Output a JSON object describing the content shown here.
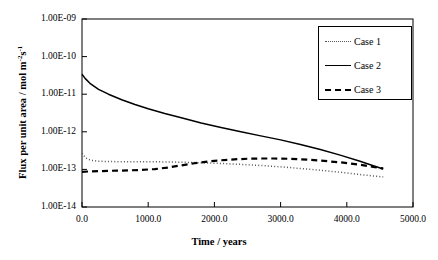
{
  "chart_data": {
    "type": "line",
    "title": "",
    "xlabel": "Time / years",
    "ylabel_html": "Flux  per unit area / mol m<sup>-2</sup>s<sup>-1</sup>",
    "ylabel_text": "Flux per unit area / mol m-2s-1",
    "xlim": [
      0,
      5000
    ],
    "ylim": [
      1e-14,
      1e-09
    ],
    "yscale": "log",
    "grid": false,
    "legend_position": "top-right",
    "xticks": [
      0,
      1000,
      2000,
      3000,
      4000,
      5000
    ],
    "xtick_labels": [
      "0.0",
      "1000.0",
      "2000.0",
      "3000.0",
      "4000.0",
      "5000.0"
    ],
    "yticks": [
      1e-09,
      1e-10,
      1e-11,
      1e-12,
      1e-13,
      1e-14
    ],
    "ytick_labels": [
      "1.00E-09",
      "1.00E-10",
      "1.00E-11",
      "1.00E-12",
      "1.00E-13",
      "1.00E-14"
    ],
    "series": [
      {
        "name": "Case 1",
        "style": "dotted",
        "color": "#555555",
        "x": [
          0,
          60,
          130,
          250,
          400,
          600,
          800,
          1000,
          1250,
          1500,
          1800,
          2100,
          2400,
          2700,
          3000,
          3300,
          3600,
          3900,
          4200,
          4400,
          4550
        ],
        "y": [
          2.7e-13,
          2e-13,
          1.75e-13,
          1.65e-13,
          1.62e-13,
          1.6e-13,
          1.6e-13,
          1.6e-13,
          1.58e-13,
          1.55e-13,
          1.5e-13,
          1.44e-13,
          1.36e-13,
          1.27e-13,
          1.17e-13,
          1.06e-13,
          9.5e-14,
          8.4e-14,
          7.3e-14,
          6.7e-14,
          6.3e-14
        ]
      },
      {
        "name": "Case 2",
        "style": "solid",
        "color": "#000000",
        "x": [
          0,
          50,
          120,
          250,
          400,
          600,
          800,
          1000,
          1250,
          1500,
          1800,
          2100,
          2400,
          2700,
          3000,
          3300,
          3600,
          3900,
          4200,
          4400,
          4550
        ],
        "y": [
          3.4e-11,
          2.6e-11,
          1.95e-11,
          1.35e-11,
          1e-11,
          7.1e-12,
          5.3e-12,
          4.1e-12,
          3.05e-12,
          2.35e-12,
          1.72e-12,
          1.3e-12,
          1e-12,
          7.8e-13,
          6.1e-13,
          4.6e-13,
          3.4e-13,
          2.4e-13,
          1.65e-13,
          1.25e-13,
          1.02e-13
        ]
      },
      {
        "name": "Case 3",
        "style": "dashed",
        "color": "#000000",
        "x": [
          0,
          100,
          250,
          450,
          700,
          900,
          1100,
          1300,
          1500,
          1700,
          1900,
          2100,
          2300,
          2500,
          2700,
          2900,
          3100,
          3300,
          3600,
          3900,
          4200,
          4400,
          4550
        ],
        "y": [
          8.6e-14,
          8.8e-14,
          9e-14,
          9.2e-14,
          9.4e-14,
          9.7e-14,
          1.02e-13,
          1.12e-13,
          1.28e-13,
          1.46e-13,
          1.62e-13,
          1.75e-13,
          1.85e-13,
          1.92e-13,
          1.95e-13,
          1.95e-13,
          1.92e-13,
          1.86e-13,
          1.72e-13,
          1.54e-13,
          1.33e-13,
          1.17e-13,
          1.06e-13
        ]
      }
    ]
  },
  "legend": {
    "items": [
      {
        "label": "Case 1"
      },
      {
        "label": "Case 2"
      },
      {
        "label": "Case 3"
      }
    ]
  },
  "axes": {
    "x_title": "Time / years",
    "y_title": "Flux  per unit area / mol m"
  }
}
